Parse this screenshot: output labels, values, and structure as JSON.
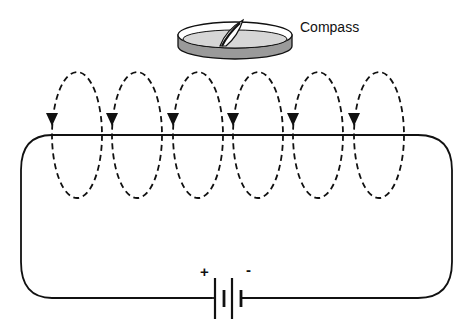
{
  "figure": {
    "compass_label": "Compass",
    "battery": {
      "positive_label": "+",
      "negative_label": "-"
    },
    "loop_count": 6,
    "colors": {
      "line": "#111111",
      "compass_rim": "#9a9a9a",
      "compass_face": "#d6d6d6",
      "background": "#ffffff"
    }
  }
}
